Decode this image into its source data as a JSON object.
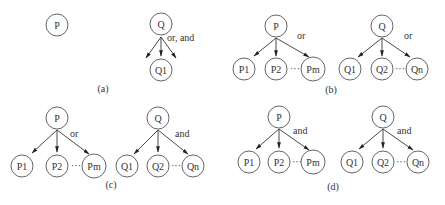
{
  "panels": {
    "a": {
      "caption": "(a)",
      "left_root": "P",
      "right_root": "Q",
      "right_child": "Q1",
      "relation": "or, and"
    },
    "b": {
      "caption": "(b)",
      "left": {
        "root": "P",
        "children": [
          "P1",
          "P2",
          "Pm"
        ],
        "ellipsis": "···",
        "relation": "or"
      },
      "right": {
        "root": "Q",
        "children": [
          "Q1",
          "Q2",
          "Qn"
        ],
        "ellipsis": "···",
        "relation": "or"
      }
    },
    "c": {
      "caption": "(c)",
      "left": {
        "root": "P",
        "children": [
          "P1",
          "P2",
          "Pm"
        ],
        "ellipsis": "···",
        "relation": "or"
      },
      "right": {
        "root": "Q",
        "children": [
          "Q1",
          "Q2",
          "Qn"
        ],
        "ellipsis": "···",
        "relation": "and"
      }
    },
    "d": {
      "caption": "(d)",
      "left": {
        "root": "P",
        "children": [
          "P1",
          "P2",
          "Pm"
        ],
        "ellipsis": "···",
        "relation": "and"
      },
      "right": {
        "root": "Q",
        "children": [
          "Q1",
          "Q2",
          "Qn"
        ],
        "ellipsis": "···",
        "relation": "and"
      }
    }
  },
  "colors": {
    "stroke": "#555555",
    "text": "#333333",
    "background": "#ffffff"
  }
}
